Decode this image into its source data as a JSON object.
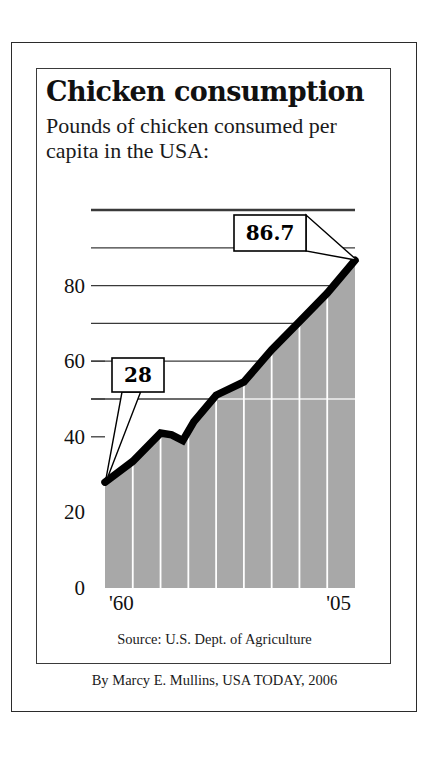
{
  "title": "Chicken consumption",
  "subtitle": "Pounds of chicken consumed per capita in the USA:",
  "source": "Source: U.S. Dept. of Agriculture",
  "byline": "By Marcy E. Mullins, USA TODAY, 2006",
  "axis": {
    "y_labels": [
      "0",
      "20",
      "40",
      "60",
      "80"
    ],
    "x_labels": [
      "'60",
      "'05"
    ]
  },
  "callouts": {
    "start": "28",
    "end": "86.7"
  },
  "colors": {
    "area_fill": "#a8a8a8",
    "line": "#000000",
    "gridline": "#3a3a3a",
    "vertical_gridline": "#ffffff",
    "text": "#111111",
    "frame": "#2b2b2b"
  },
  "chart_data": {
    "type": "area",
    "title": "Chicken consumption",
    "subtitle": "Pounds of chicken consumed per capita in the USA:",
    "xlabel": "",
    "ylabel": "Pounds per capita",
    "xlim": [
      1960,
      2005
    ],
    "ylim": [
      0,
      100
    ],
    "ytick_values": [
      0,
      20,
      40,
      60,
      80
    ],
    "ytick_labels": [
      "0",
      "20",
      "40",
      "60",
      "80"
    ],
    "gridline_values": [
      50,
      60,
      70,
      80,
      90,
      100
    ],
    "xtick_values": [
      1960,
      2005
    ],
    "xtick_labels": [
      "'60",
      "'05"
    ],
    "vertical_gridline_years": [
      1965,
      1970,
      1975,
      1980,
      1985,
      1990,
      1995,
      2000
    ],
    "grid": true,
    "legend": "none",
    "annotations": [
      {
        "label": "28",
        "x": 1960,
        "y": 28
      },
      {
        "label": "86.7",
        "x": 2005,
        "y": 86.7
      }
    ],
    "x": [
      1960,
      1965,
      1970,
      1972,
      1974,
      1976,
      1980,
      1985,
      1990,
      1995,
      2000,
      2005
    ],
    "values": [
      28,
      33.5,
      41,
      40.5,
      39,
      44,
      51,
      54.5,
      63,
      70.5,
      78,
      86.7
    ],
    "series": [
      {
        "name": "Pounds of chicken consumed per capita",
        "values": [
          28,
          33.5,
          41,
          40.5,
          39,
          44,
          51,
          54.5,
          63,
          70.5,
          78,
          86.7
        ]
      }
    ]
  }
}
